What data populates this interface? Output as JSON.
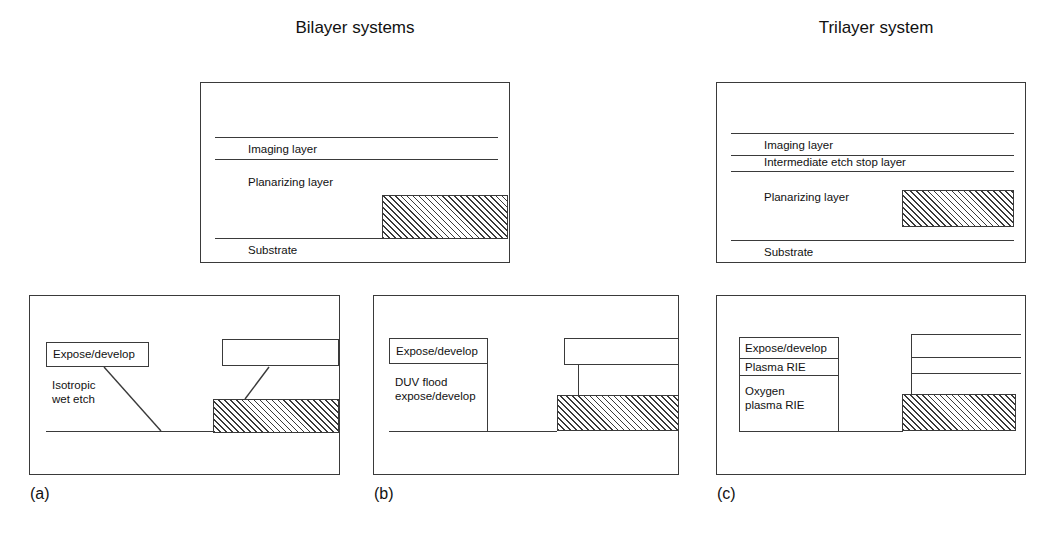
{
  "figure": {
    "titles": {
      "bilayer": "Bilayer systems",
      "trilayer": "Trilayer system"
    },
    "captions": {
      "a": "(a)",
      "b": "(b)",
      "c": "(c)"
    }
  },
  "bilayer_stack": {
    "layers": [
      {
        "name": "imaging-layer",
        "label": "Imaging layer"
      },
      {
        "name": "planarizing-layer",
        "label": "Planarizing layer"
      },
      {
        "name": "substrate",
        "label": "Substrate"
      }
    ]
  },
  "trilayer_stack": {
    "layers": [
      {
        "name": "imaging-layer",
        "label": "Imaging layer"
      },
      {
        "name": "intermediate-etch-stop-layer",
        "label": "Intermediate etch stop layer"
      },
      {
        "name": "planarizing-layer",
        "label": "Planarizing layer"
      },
      {
        "name": "substrate",
        "label": "Substrate"
      }
    ]
  },
  "panel_a": {
    "caption": "(a)",
    "process_steps": [
      {
        "name": "expose-develop",
        "label": "Expose/develop",
        "boxed": true
      },
      {
        "name": "isotropic-wet-etch",
        "label": "Isotropic\nwet etch",
        "line1": "Isotropic",
        "line2": "wet etch",
        "boxed": false
      }
    ],
    "profile": "isotropic-sloped-sidewall"
  },
  "panel_b": {
    "caption": "(b)",
    "process_steps": [
      {
        "name": "expose-develop",
        "label": "Expose/develop",
        "boxed": true
      },
      {
        "name": "duv-flood-expose-develop",
        "label": "DUV flood\nexpose/develop",
        "line1": "DUV flood",
        "line2": "expose/develop",
        "boxed": false
      }
    ],
    "profile": "vertical-sidewall"
  },
  "panel_c": {
    "caption": "(c)",
    "process_steps": [
      {
        "name": "expose-develop",
        "label": "Expose/develop",
        "boxed": true
      },
      {
        "name": "plasma-rie",
        "label": "Plasma RIE",
        "boxed": true
      },
      {
        "name": "oxygen-plasma-rie",
        "label": "Oxygen\nplasma RIE",
        "line1": "Oxygen",
        "line2": "plasma RIE",
        "boxed": true
      }
    ],
    "profile": "anisotropic-stepped-sidewall"
  },
  "colors": {
    "line": "#3a3a3a",
    "text": "#111111",
    "background": "#ffffff",
    "hatch": "#3a3a3a"
  }
}
